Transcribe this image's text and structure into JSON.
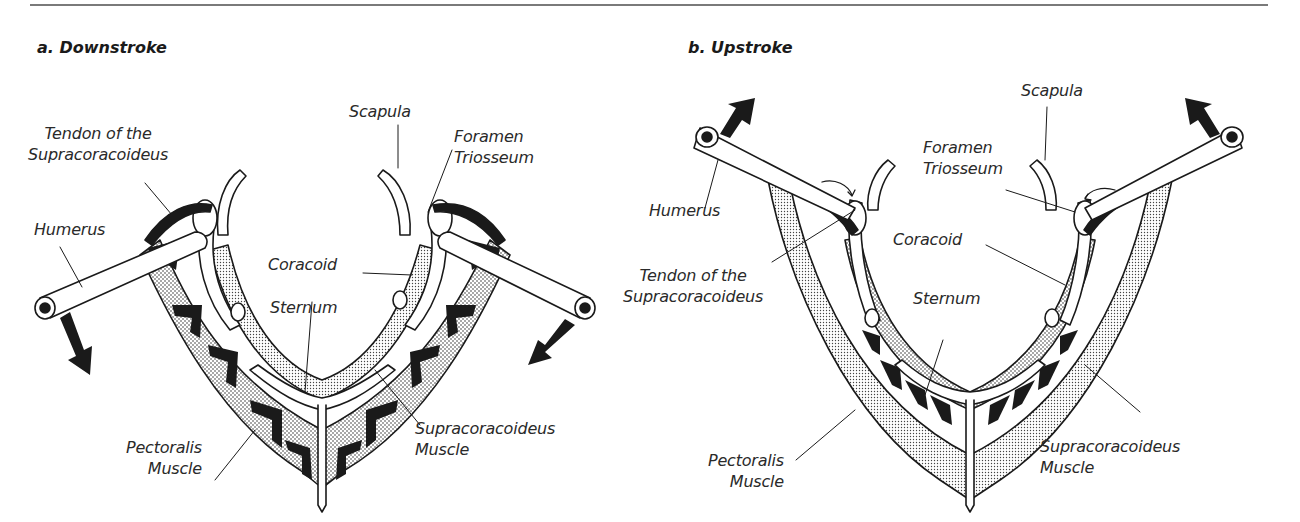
{
  "figure": {
    "panels": [
      {
        "id": "a",
        "title": "a. Downstroke",
        "labels": {
          "tendon": "Tendon of the\nSupracoracoideus",
          "scapula": "Scapula",
          "foramen": "Foramen\nTriosseum",
          "humerus": "Humerus",
          "coracoid": "Coracoid",
          "sternum": "Sternum",
          "pectoralis": "Pectoralis\nMuscle",
          "supracoracoideus": "Supracoracoideus\nMuscle"
        },
        "arrows": "down"
      },
      {
        "id": "b",
        "title": "b. Upstroke",
        "labels": {
          "scapula": "Scapula",
          "foramen": "Foramen\nTriosseum",
          "humerus": "Humerus",
          "coracoid": "Coracoid",
          "tendon": "Tendon of the\nSupracoracoideus",
          "sternum": "Sternum",
          "pectoralis": "Pectoralis\nMuscle",
          "supracoracoideus": "Supracoracoideus\nMuscle"
        },
        "arrows": "up"
      }
    ],
    "colors": {
      "ink": "#1a1a1a",
      "stipple": "#bdbdbd",
      "paper": "#ffffff",
      "rule": "#7a7a7a"
    }
  }
}
